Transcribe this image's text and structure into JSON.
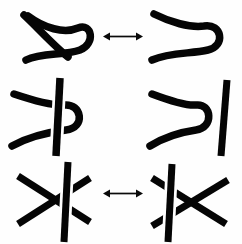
{
  "figure": {
    "title": "Reidemeister Moves",
    "caption": "The three Reidemeister moves relating equivalent knot diagrams.",
    "width": 242,
    "height": 244,
    "background_color": "#fefefe",
    "stroke_color": "#050505",
    "arrow_color": "#0a0a0a"
  },
  "rows": [
    {
      "id": "reidemeister-1",
      "name": "Reidemeister move I",
      "short_label": "R1",
      "description": "Twist / untwist a kink in a single strand",
      "top": 0,
      "left_panel": {
        "name": "strand-with-loop",
        "description": "Single strand crossing itself to form a loop",
        "crossings": 1
      },
      "right_panel": {
        "name": "strand-without-loop",
        "description": "Same strand pulled straight into a simple bend",
        "crossings": 0
      },
      "arrow": {
        "name": "equivalence-arrow",
        "kind": "double-headed",
        "x": 103,
        "y": 36,
        "length": 39
      }
    },
    {
      "id": "reidemeister-2",
      "name": "Reidemeister move II",
      "short_label": "R2",
      "description": "Poke / unpoke one strand across another",
      "top": 76,
      "left_panel": {
        "name": "strand-poked-through-line",
        "description": "Bent strand poked across a vertical strand creating two crossings",
        "crossings": 2
      },
      "right_panel": {
        "name": "strand-withdrawn-from-line",
        "description": "Bent strand withdrawn so the two strands are disjoint",
        "crossings": 0
      },
      "arrow": {
        "name": "equivalence-arrow",
        "kind": "double-headed",
        "x": 103,
        "y": 117,
        "length": 39
      }
    },
    {
      "id": "reidemeister-3",
      "name": "Reidemeister move III",
      "short_label": "R3",
      "description": "Slide a strand past a crossing of two other strands",
      "top": 158,
      "left_panel": {
        "name": "strand-right-of-crossing",
        "description": "Vertical strand lies to the right of the diagonal crossing",
        "crossings": 3
      },
      "right_panel": {
        "name": "strand-left-of-crossing",
        "description": "Vertical strand slid to the left of the diagonal crossing",
        "crossings": 3
      },
      "arrow": {
        "name": "equivalence-arrow",
        "kind": "double-headed",
        "x": 103,
        "y": 200,
        "length": 39
      }
    }
  ]
}
